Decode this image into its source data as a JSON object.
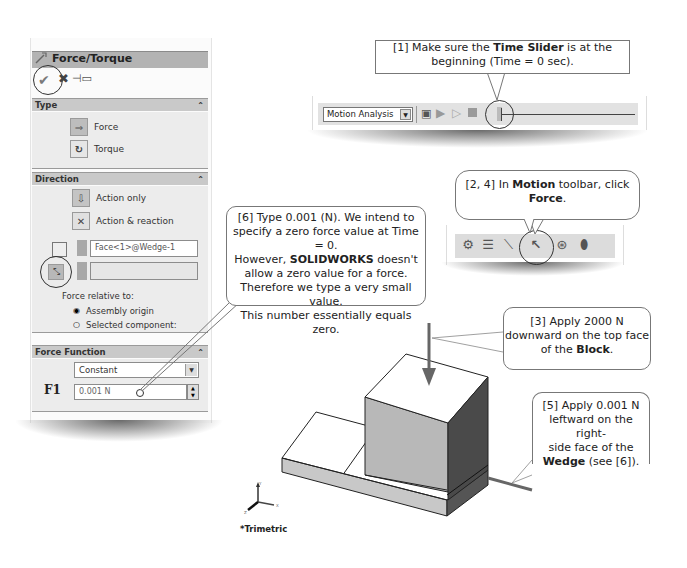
{
  "property_manager": {
    "title": "Force/Torque",
    "actions": {
      "ok_icon": "check-icon",
      "cancel_icon": "x-icon",
      "pin_icon": "pushpin-icon"
    },
    "sections": {
      "type": {
        "header": "Type",
        "options": [
          {
            "label": "Force",
            "icon": "force-arrow-icon",
            "selected": true
          },
          {
            "label": "Torque",
            "icon": "torque-icon",
            "selected": false
          }
        ]
      },
      "direction": {
        "header": "Direction",
        "options": [
          {
            "label": "Action only",
            "selected": true
          },
          {
            "label": "Action & reaction",
            "selected": false
          }
        ],
        "face_selection": "Face<1>@Wedge-1",
        "direction_selection": "",
        "relative_label": "Force relative to:",
        "relative_options": [
          {
            "label": "Assembly origin",
            "selected": true
          },
          {
            "label": "Selected component:",
            "selected": false
          }
        ]
      },
      "force_function": {
        "header": "Force Function",
        "function_type": "Constant",
        "f1_label": "F1",
        "f1_value": "0.001 N"
      }
    }
  },
  "motion_manager_toolbar": {
    "study_type": "Motion Analysis",
    "buttons": [
      "calculate",
      "play-from-start",
      "play",
      "stop"
    ],
    "time_slider_position": 0
  },
  "motion_toolbar": {
    "icons": [
      "motor-icon",
      "spring-icon",
      "damper-icon",
      "force-icon",
      "contact-icon",
      "gravity-icon"
    ]
  },
  "callouts": {
    "c1": {
      "pre": "[1] Make sure the ",
      "bold": "Time Slider",
      "post": " is at the beginning (Time = 0 sec)."
    },
    "c24": {
      "pre": "[2, 4] In ",
      "bold": "Motion",
      "mid": " toolbar, click ",
      "bold2": "Force",
      "post": "."
    },
    "c6": {
      "line1": "[6] Type 0.001 (N). We intend to",
      "line2": "specify a zero force value at Time = 0.",
      "line3_pre": "However, ",
      "line3_bold": "SOLIDWORKS",
      "line3_post": " doesn't",
      "line4": "allow a zero value for a force.",
      "line5": "Therefore we type a very small value.",
      "line6": "This number essentially equals zero."
    },
    "c3": {
      "line1": "[3] Apply 2000 N",
      "line2": "downward on the top face",
      "line3_pre": "of the ",
      "line3_bold": "Block",
      "line3_post": "."
    },
    "c5": {
      "line1": "[5] Apply 0.001 N",
      "line2": "leftward on the right-",
      "line3": "side face of the",
      "line4_bold": "Wedge",
      "line4_post": " (see [6])."
    }
  },
  "viewport": {
    "view_label": "*Trimetric",
    "triad": {
      "x": "X",
      "y": "Y",
      "z": "Z"
    }
  }
}
